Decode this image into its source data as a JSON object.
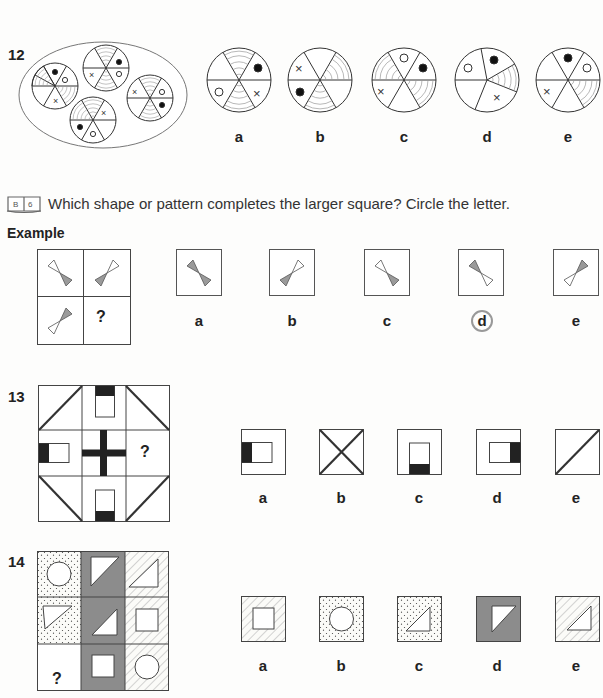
{
  "q12": {
    "number": "12",
    "options": [
      {
        "letter": "a"
      },
      {
        "letter": "b"
      },
      {
        "letter": "c"
      },
      {
        "letter": "d"
      },
      {
        "letter": "e"
      }
    ]
  },
  "instruction": {
    "icon": "book-icon",
    "icon_text": "B|6",
    "text": "Which shape or pattern completes the larger square? Circle the letter."
  },
  "example": {
    "title": "Example",
    "question_mark": "?",
    "options": [
      {
        "letter": "a"
      },
      {
        "letter": "b"
      },
      {
        "letter": "c"
      },
      {
        "letter": "d",
        "circled": true
      },
      {
        "letter": "e"
      }
    ]
  },
  "q13": {
    "number": "13",
    "question_mark": "?",
    "options": [
      {
        "letter": "a"
      },
      {
        "letter": "b"
      },
      {
        "letter": "c"
      },
      {
        "letter": "d"
      },
      {
        "letter": "e"
      }
    ]
  },
  "q14": {
    "number": "14",
    "question_mark": "?",
    "options": [
      {
        "letter": "a"
      },
      {
        "letter": "b"
      },
      {
        "letter": "c"
      },
      {
        "letter": "d"
      },
      {
        "letter": "e"
      }
    ]
  },
  "colors": {
    "line": "#333333",
    "grey_fill": "#8c8c8c",
    "dark_fill": "#222222",
    "bowtie_grey": "#9a9a9a",
    "circle_mark": "#999999"
  }
}
